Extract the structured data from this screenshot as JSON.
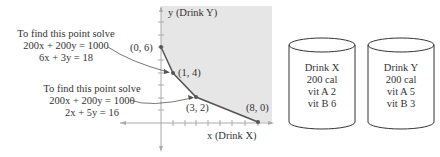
{
  "notes": [
    {
      "line1": "To find this point solve",
      "line2": "200x + 200y = 1000",
      "line3": "6x + 3y = 18"
    },
    {
      "line1": "To find this point solve",
      "line2": "200x + 200y = 1000",
      "line3": "2x + 5y = 16"
    }
  ],
  "graph": {
    "y_label": "y (Drink Y)",
    "x_label": "x (Drink X)",
    "vertices": [
      {
        "label": "(0, 6)",
        "x": 0,
        "y": 6
      },
      {
        "label": "(1, 4)",
        "x": 1,
        "y": 4
      },
      {
        "label": "(3, 2)",
        "x": 3,
        "y": 2
      },
      {
        "label": "(8, 0)",
        "x": 8,
        "y": 0
      }
    ],
    "region_color": "#e6e6e6",
    "boundary_color": "#555555"
  },
  "drinks": [
    {
      "name": "Drink X",
      "calories": "200 cal",
      "vit_a": "vit A 2",
      "vit_b": "vit B 6"
    },
    {
      "name": "Drink Y",
      "calories": "200 cal",
      "vit_a": "vit A 5",
      "vit_b": "vit B 3"
    }
  ]
}
